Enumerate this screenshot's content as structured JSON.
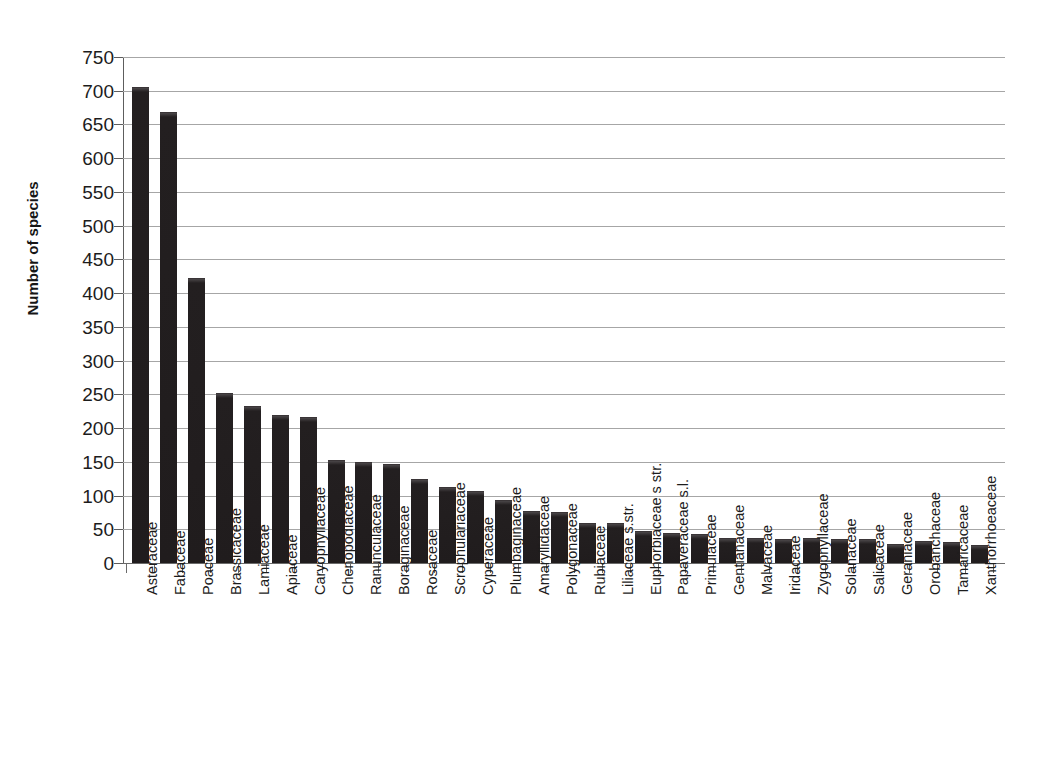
{
  "chart_data": {
    "type": "bar",
    "title": "",
    "xlabel": "",
    "ylabel": "Number of species",
    "ylim": [
      0,
      750
    ],
    "ytick_step": 50,
    "yticks": [
      0,
      50,
      100,
      150,
      200,
      250,
      300,
      350,
      400,
      450,
      500,
      550,
      600,
      650,
      700,
      750
    ],
    "ytick_labels": [
      "0",
      "50",
      "100",
      "150",
      "200",
      "250",
      "300",
      "350",
      "400",
      "450",
      "500",
      "550",
      "600",
      "650",
      "700",
      "750"
    ],
    "grid": true,
    "grid_axis": "y",
    "legend": "none",
    "bar_color": "#231f20",
    "gridline_color": "#a6a6a6",
    "axis_color": "#5d5d5d",
    "categories": [
      "Asteraceae",
      "Fabaceae",
      "Poaceae",
      "Brassicaceae",
      "Lamiaceae",
      "Apiaceae",
      "Caryophyllaceae",
      "Chenopodiaceae",
      "Ranunculaceae",
      "Boraginaceae",
      "Rosaceae",
      "Scrophulariaceae",
      "Cyperaceae",
      "Plumbaginaceae",
      "Amaryllidaceae",
      "Polygonaceae",
      "Rubiaceae",
      "Liliaceae s.str.",
      "Euphorbiaceae s str.",
      "Papaveraceae s.l.",
      "Primulaceae",
      "Gentianaceae",
      "Malvaceae",
      "Iridaceae",
      "Zygophyllaceae",
      "Solanaceae",
      "Salicaceae",
      "Geraniaceae",
      "Orobanchaceae",
      "Tamaricaceae",
      "Xanthorrhoeaceae"
    ],
    "values": [
      705,
      668,
      422,
      252,
      232,
      220,
      217,
      153,
      150,
      147,
      125,
      113,
      107,
      93,
      77,
      75,
      60,
      60,
      47,
      45,
      43,
      37,
      37,
      36,
      37,
      35,
      35,
      28,
      32,
      31,
      27
    ]
  }
}
